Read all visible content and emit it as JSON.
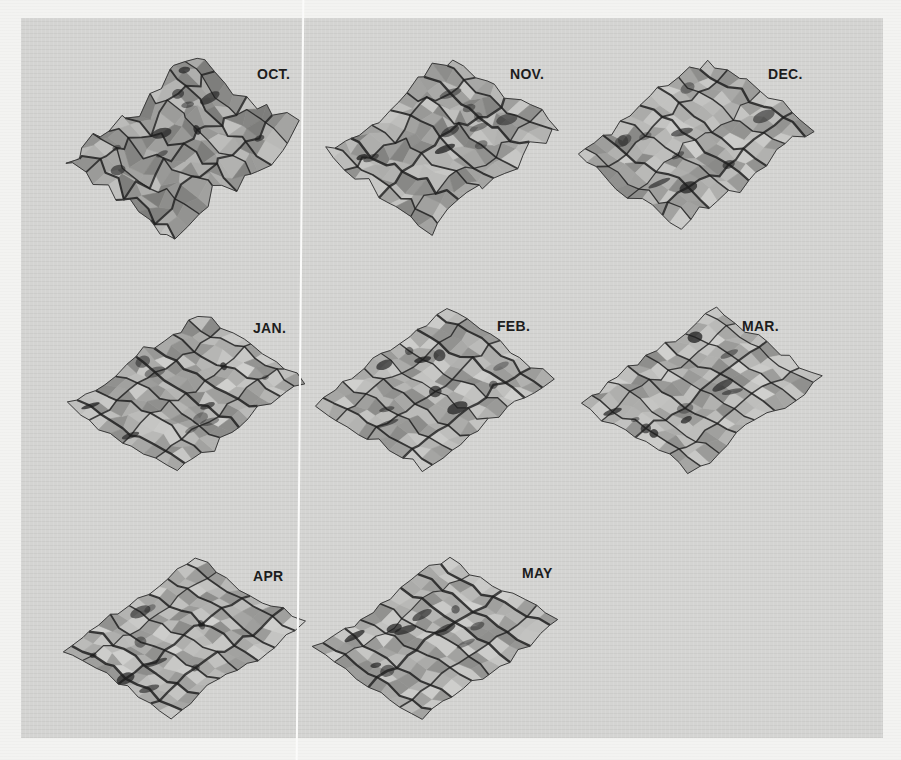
{
  "figure": {
    "panels": [
      {
        "id": "oct",
        "label": "OCT.",
        "x": 62,
        "y": 55,
        "w": 240,
        "h": 185,
        "label_x": 257,
        "label_y": 66,
        "ruggedness": 1.0
      },
      {
        "id": "nov",
        "label": "NOV.",
        "x": 320,
        "y": 52,
        "w": 245,
        "h": 180,
        "label_x": 510,
        "label_y": 66,
        "ruggedness": 0.8
      },
      {
        "id": "dec",
        "label": "DEC.",
        "x": 572,
        "y": 52,
        "w": 245,
        "h": 180,
        "label_x": 768,
        "label_y": 66,
        "ruggedness": 0.55
      },
      {
        "id": "jan",
        "label": "JAN.",
        "x": 65,
        "y": 310,
        "w": 245,
        "h": 165,
        "label_x": 253,
        "label_y": 320,
        "ruggedness": 0.5
      },
      {
        "id": "feb",
        "label": "FEB.",
        "x": 312,
        "y": 305,
        "w": 245,
        "h": 170,
        "label_x": 497,
        "label_y": 318,
        "ruggedness": 0.45
      },
      {
        "id": "mar",
        "label": "MAR.",
        "x": 577,
        "y": 305,
        "w": 250,
        "h": 170,
        "label_x": 742,
        "label_y": 318,
        "ruggedness": 0.45
      },
      {
        "id": "apr",
        "label": "APR",
        "x": 58,
        "y": 555,
        "w": 250,
        "h": 165,
        "label_x": 253,
        "label_y": 568,
        "ruggedness": 0.4
      },
      {
        "id": "may",
        "label": "MAY",
        "x": 310,
        "y": 552,
        "w": 252,
        "h": 170,
        "label_x": 522,
        "label_y": 565,
        "ruggedness": 0.4
      }
    ]
  },
  "colors": {
    "panel_bg": "#d4d4d2",
    "page_bg": "#f3f3f1",
    "surface_light": "#c8c8c6",
    "surface_mid": "#9a9a98",
    "ridge": "#1e1e1e"
  }
}
